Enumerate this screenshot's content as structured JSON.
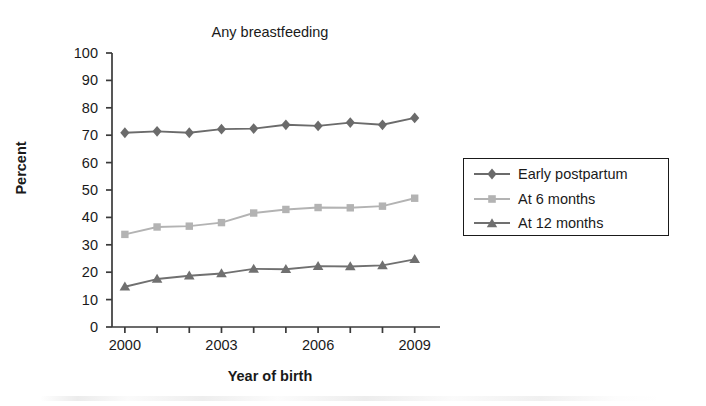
{
  "chart_data": {
    "type": "line",
    "title": "Any breastfeeding",
    "xlabel": "Year of birth",
    "ylabel": "Percent",
    "x": [
      2000,
      2001,
      2002,
      2003,
      2004,
      2005,
      2006,
      2007,
      2008,
      2009
    ],
    "xlim": [
      1999.6,
      2009.6
    ],
    "ylim": [
      0,
      100
    ],
    "ytick_values": [
      0,
      10,
      20,
      30,
      40,
      50,
      60,
      70,
      80,
      90,
      100
    ],
    "ytick_labels": [
      "0",
      "10",
      "20",
      "30",
      "40",
      "50",
      "60",
      "70",
      "80",
      "90",
      "100"
    ],
    "xtick_values": [
      2000,
      2001,
      2002,
      2003,
      2004,
      2005,
      2006,
      2007,
      2008,
      2009
    ],
    "xtick_labels": [
      "2000",
      "",
      "",
      "2003",
      "",
      "",
      "2006",
      "",
      "",
      "2009"
    ],
    "grid": false,
    "legend_position": "right",
    "series": [
      {
        "name": "Early postpartum",
        "marker": "diamond",
        "color": "#6b6b6b",
        "values": [
          70.9,
          71.4,
          70.9,
          72.2,
          72.4,
          73.8,
          73.4,
          74.6,
          73.8,
          76.3
        ]
      },
      {
        "name": "At 6 months",
        "marker": "square",
        "color": "#b3b3b3",
        "values": [
          33.8,
          36.5,
          36.8,
          38.1,
          41.6,
          42.9,
          43.6,
          43.5,
          44.1,
          47.0
        ]
      },
      {
        "name": "At 12 months",
        "marker": "triangle",
        "color": "#707070",
        "values": [
          14.7,
          17.5,
          18.7,
          19.5,
          21.2,
          21.1,
          22.2,
          22.1,
          22.5,
          24.7
        ]
      }
    ]
  },
  "legend": {
    "entries": [
      {
        "label": "Early postpartum"
      },
      {
        "label": "At 6 months"
      },
      {
        "label": "At 12 months"
      }
    ]
  }
}
